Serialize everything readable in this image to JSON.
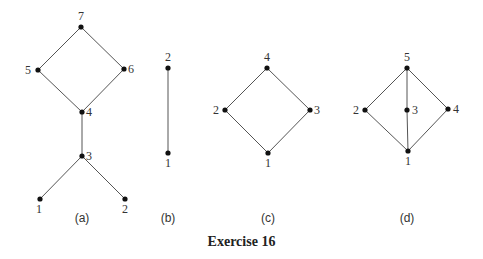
{
  "caption": "Exercise 16",
  "diagrams": [
    {
      "id": "a",
      "label": "(a)",
      "label_pos": [
        82,
        222
      ],
      "nodes": [
        {
          "name": "7",
          "x": 81,
          "y": 27,
          "lx": 81,
          "ly": 20,
          "anchor": "middle"
        },
        {
          "name": "5",
          "x": 38,
          "y": 70,
          "lx": 31,
          "ly": 74,
          "anchor": "end"
        },
        {
          "name": "6",
          "x": 124,
          "y": 69,
          "lx": 128,
          "ly": 73,
          "anchor": "start"
        },
        {
          "name": "4",
          "x": 82,
          "y": 112,
          "lx": 86,
          "ly": 116,
          "anchor": "start"
        },
        {
          "name": "3",
          "x": 82,
          "y": 156,
          "lx": 86,
          "ly": 160,
          "anchor": "start"
        },
        {
          "name": "1",
          "x": 40,
          "y": 199,
          "lx": 39,
          "ly": 213,
          "anchor": "middle"
        },
        {
          "name": "2",
          "x": 125,
          "y": 199,
          "lx": 125,
          "ly": 213,
          "anchor": "middle"
        }
      ],
      "edges": [
        [
          "7",
          "5"
        ],
        [
          "7",
          "6"
        ],
        [
          "5",
          "4"
        ],
        [
          "6",
          "4"
        ],
        [
          "4",
          "3"
        ],
        [
          "3",
          "1"
        ],
        [
          "3",
          "2"
        ]
      ]
    },
    {
      "id": "b",
      "label": "(b)",
      "label_pos": [
        168,
        222
      ],
      "nodes": [
        {
          "name": "2",
          "x": 168,
          "y": 68,
          "lx": 168,
          "ly": 61,
          "anchor": "middle"
        },
        {
          "name": "1",
          "x": 168,
          "y": 153,
          "lx": 168,
          "ly": 167,
          "anchor": "middle"
        }
      ],
      "edges": [
        [
          "2",
          "1"
        ]
      ]
    },
    {
      "id": "c",
      "label": "(c)",
      "label_pos": [
        268,
        222
      ],
      "nodes": [
        {
          "name": "4",
          "x": 267,
          "y": 68,
          "lx": 267,
          "ly": 61,
          "anchor": "middle"
        },
        {
          "name": "2",
          "x": 225,
          "y": 110,
          "lx": 219,
          "ly": 114,
          "anchor": "end"
        },
        {
          "name": "3",
          "x": 310,
          "y": 110,
          "lx": 314,
          "ly": 114,
          "anchor": "start"
        },
        {
          "name": "1",
          "x": 268,
          "y": 153,
          "lx": 268,
          "ly": 167,
          "anchor": "middle"
        }
      ],
      "edges": [
        [
          "4",
          "2"
        ],
        [
          "4",
          "3"
        ],
        [
          "2",
          "1"
        ],
        [
          "3",
          "1"
        ]
      ]
    },
    {
      "id": "d",
      "label": "(d)",
      "label_pos": [
        407,
        222
      ],
      "nodes": [
        {
          "name": "5",
          "x": 407,
          "y": 68,
          "lx": 407,
          "ly": 61,
          "anchor": "middle"
        },
        {
          "name": "2",
          "x": 365,
          "y": 110,
          "lx": 359,
          "ly": 114,
          "anchor": "end"
        },
        {
          "name": "3",
          "x": 407,
          "y": 110,
          "lx": 412,
          "ly": 114,
          "anchor": "start"
        },
        {
          "name": "4",
          "x": 448,
          "y": 109,
          "lx": 453,
          "ly": 113,
          "anchor": "start"
        },
        {
          "name": "1",
          "x": 408,
          "y": 151,
          "lx": 408,
          "ly": 165,
          "anchor": "middle"
        }
      ],
      "edges": [
        [
          "5",
          "2"
        ],
        [
          "5",
          "3"
        ],
        [
          "5",
          "4"
        ],
        [
          "3",
          "1"
        ],
        [
          "2",
          "1"
        ],
        [
          "4",
          "1"
        ]
      ]
    }
  ]
}
